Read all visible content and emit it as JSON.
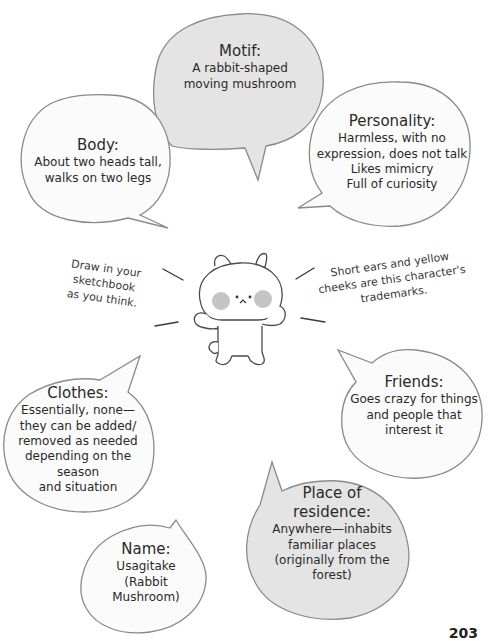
{
  "colors": {
    "outline": "#8a8a8a",
    "white_bubble": "#fbfbfb",
    "gray_bubble": "#e4e4e4",
    "cheek": "#c4c4c4",
    "text": "#2a2a2a"
  },
  "bubbles": {
    "motif": {
      "title": "Motif:",
      "lines": [
        "A rabbit-shaped",
        "moving mushroom"
      ]
    },
    "body": {
      "title": "Body:",
      "lines": [
        "About two heads tall,",
        "walks on two legs"
      ]
    },
    "personality": {
      "title": "Personality:",
      "lines": [
        "Harmless, with no",
        "expression, does not talk",
        "Likes mimicry",
        "Full of curiosity"
      ]
    },
    "friends": {
      "title": "Friends:",
      "lines": [
        "Goes crazy for things",
        "and people that",
        "interest it"
      ]
    },
    "clothes": {
      "title": "Clothes:",
      "lines": [
        "Essentially, none—",
        "they can be added/",
        "removed as needed",
        "depending on the season",
        "and situation"
      ]
    },
    "residence": {
      "title": "Place of residence:",
      "lines": [
        "Anywhere—inhabits",
        "familiar places",
        "(originally from the",
        "forest)"
      ]
    },
    "name": {
      "title": "Name:",
      "lines": [
        "Usagitake",
        "(Rabbit Mushroom)"
      ]
    }
  },
  "notes": {
    "left": [
      "Draw in your sketchbook",
      "as you think."
    ],
    "right": [
      "Short ears and yellow",
      "cheeks are this character's",
      "trademarks."
    ]
  },
  "character": {
    "name": "rabbit-mushroom-character"
  },
  "page_number": "203"
}
